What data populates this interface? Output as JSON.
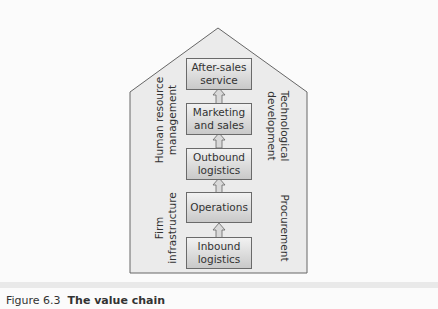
{
  "diagram": {
    "title": "The value chain",
    "primary_activities": [
      {
        "label": "After-sales service",
        "line1": "After-sales",
        "line2": "service"
      },
      {
        "label": "Marketing and sales",
        "line1": "Marketing",
        "line2": "and sales"
      },
      {
        "label": "Outbound logistics",
        "line1": "Outbound",
        "line2": "logistics"
      },
      {
        "label": "Operations",
        "line1": "Operations",
        "line2": ""
      },
      {
        "label": "Inbound logistics",
        "line1": "Inbound",
        "line2": "logistics"
      }
    ],
    "support_activities": {
      "left_top": {
        "line1": "Human resource",
        "line2": "management"
      },
      "left_bottom": {
        "line1": "Firm",
        "line2": "infrastructure"
      },
      "right_top": {
        "line1": "Technological",
        "line2": "development"
      },
      "right_bottom": {
        "line1": "Procurement",
        "line2": ""
      }
    },
    "colors": {
      "house_fill": "#ebebeb",
      "outline": "#666666",
      "box_top": "#f2f2f2",
      "box_bottom": "#c9c9c9"
    }
  },
  "caption": {
    "figure_number": "Figure 6.3",
    "title": "The value chain"
  }
}
